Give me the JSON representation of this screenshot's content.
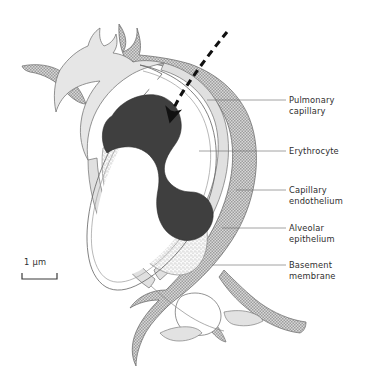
{
  "figure": {
    "background_color": "#ffffff",
    "ink_color": "#2e2e2e"
  },
  "labels": [
    {
      "id": "pulmonary-capillary",
      "line1": "Pulmonary",
      "line2": "capillary",
      "leader": {
        "x1": 207,
        "y1": 100,
        "x2": 286,
        "y2": 100
      },
      "text_x": 289,
      "text_y": 103
    },
    {
      "id": "erythrocyte",
      "line1": "Erythrocyte",
      "line2": "",
      "leader": {
        "x1": 199,
        "y1": 151,
        "x2": 286,
        "y2": 151
      },
      "text_x": 289,
      "text_y": 154
    },
    {
      "id": "capillary-endothelium",
      "line1": "Capillary",
      "line2": "endothelium",
      "leader": {
        "x1": 236,
        "y1": 190,
        "x2": 286,
        "y2": 190
      },
      "text_x": 289,
      "text_y": 193
    },
    {
      "id": "alveolar-epithelium",
      "line1": "Alveolar",
      "line2": "epithelium",
      "leader": {
        "x1": 222,
        "y1": 228,
        "x2": 286,
        "y2": 228
      },
      "text_x": 289,
      "text_y": 231
    },
    {
      "id": "basement-membrane",
      "line1": "Basement",
      "line2": "membrane",
      "leader": {
        "x1": 212,
        "y1": 265,
        "x2": 286,
        "y2": 265
      },
      "text_x": 289,
      "text_y": 268
    }
  ],
  "scale_bar": {
    "text": "1 μm",
    "text_x": 24,
    "text_y": 265,
    "bar_x1": 22,
    "bar_x2": 57,
    "bar_y": 279,
    "tick_height": 6
  },
  "annotation_arrow": {
    "name": "diffusion-path-arrow",
    "description": "dashed curved arrow entering capillary",
    "style": "dashed-with-solid-head",
    "color": "#111111"
  },
  "colors": {
    "erythrocyte_fill": "#3f3f3f",
    "basement_membrane_fill": "#b9b9b9",
    "endothelium_fill": "#dedede",
    "epithelium_fill": "#e8e8e8",
    "alveolar_space_fill": "#f0f0f0",
    "plasma_fill": "#ffffff",
    "outline": "#6a6a6a"
  }
}
